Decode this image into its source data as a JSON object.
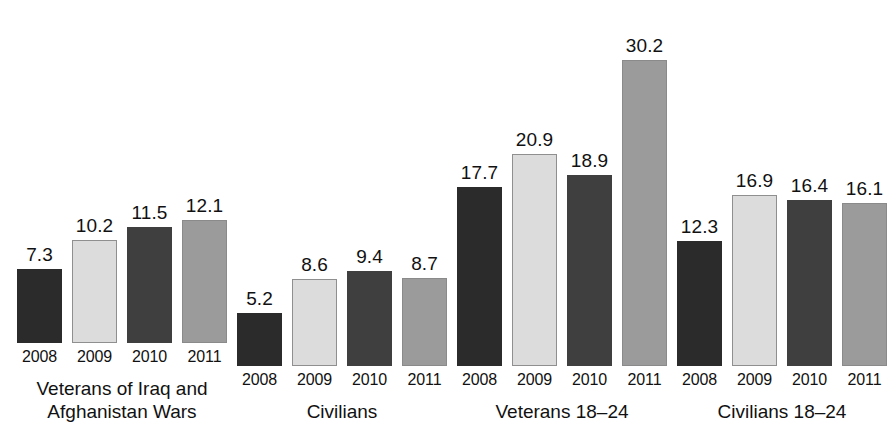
{
  "chart_data": {
    "type": "bar",
    "title": "",
    "subtitle": "",
    "xlabel": "",
    "ylabel": "",
    "ylim": [
      0,
      30.2
    ],
    "grid": false,
    "legend_position": "none",
    "categories": [
      "2008",
      "2009",
      "2010",
      "2011"
    ],
    "groups": [
      {
        "label": "Veterans of Iraq and",
        "label_line2": "Afghanistan Wars",
        "values": [
          7.3,
          10.2,
          11.5,
          12.1
        ],
        "value_labels": [
          "7.3",
          "10.2",
          "11.5",
          "12.1"
        ],
        "year_labels": [
          "2008",
          "2009",
          "2010",
          "2011"
        ]
      },
      {
        "label": "Civilians",
        "label_line2": "",
        "values": [
          5.2,
          8.6,
          9.4,
          8.7
        ],
        "value_labels": [
          "5.2",
          "8.6",
          "9.4",
          "8.7"
        ],
        "year_labels": [
          "2008",
          "2009",
          "2010",
          "2011"
        ]
      },
      {
        "label": "Veterans 18–24",
        "label_line2": "",
        "values": [
          17.7,
          20.9,
          18.9,
          30.2
        ],
        "value_labels": [
          "17.7",
          "20.9",
          "18.9",
          "30.2"
        ],
        "year_labels": [
          "2008",
          "2009",
          "2010",
          "2011"
        ]
      },
      {
        "label": "Civilians 18–24",
        "label_line2": "",
        "values": [
          12.3,
          16.9,
          16.4,
          16.1
        ],
        "value_labels": [
          "12.3",
          "16.9",
          "16.4",
          "16.1"
        ],
        "year_labels": [
          "2008",
          "2009",
          "2010",
          "2011"
        ]
      }
    ],
    "series_colors": [
      "#2b2b2b",
      "#dcdcdc",
      "#3f3f3f",
      "#9b9b9b"
    ],
    "series_border_colors": [
      "#2b2b2b",
      "#8f8f8f",
      "#3f3f3f",
      "#8a8a8a"
    ],
    "max_value": 30.2,
    "pixels_per_unit": 10.13
  }
}
